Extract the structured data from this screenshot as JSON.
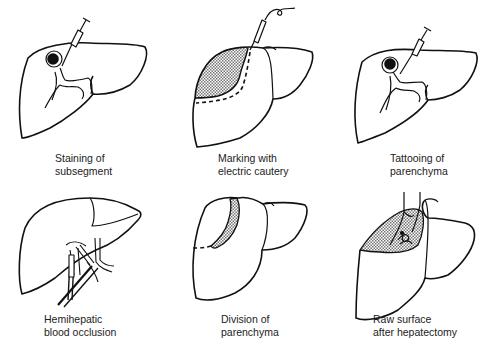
{
  "figure": {
    "type": "procedure-diagram",
    "layout": {
      "rows": 2,
      "cols": 3
    },
    "colors": {
      "line": "#111111",
      "background": "#ffffff",
      "hatch": "#888888",
      "caption": "#222222"
    },
    "panels": [
      {
        "id": "staining",
        "caption_lines": [
          "Staining of",
          "subsegment"
        ],
        "icons": [
          "liver-icon",
          "syringe-icon",
          "portal-vein-icon",
          "tumor-icon"
        ]
      },
      {
        "id": "marking",
        "caption_lines": [
          "Marking with",
          "electric cautery"
        ],
        "icons": [
          "liver-icon",
          "cautery-probe-icon",
          "stained-area-icon",
          "dashed-resection-line-icon"
        ]
      },
      {
        "id": "tattooing",
        "caption_lines": [
          "Tattooing of",
          "parenchyma"
        ],
        "icons": [
          "liver-icon",
          "syringe-icon",
          "portal-vein-icon",
          "tumor-icon"
        ]
      },
      {
        "id": "occlusion",
        "caption_lines": [
          "Hemihepatic",
          "blood occlusion"
        ],
        "icons": [
          "liver-icon",
          "vascular-clamp-icon",
          "hilar-vessels-icon"
        ]
      },
      {
        "id": "division",
        "caption_lines": [
          "Division of",
          "parenchyma"
        ],
        "icons": [
          "liver-icon",
          "transection-plane-icon",
          "dashed-resection-line-icon"
        ]
      },
      {
        "id": "raw-surface",
        "caption_lines": [
          "Raw surface",
          "after hepatectomy"
        ],
        "icons": [
          "liver-icon",
          "raw-surface-icon",
          "vessel-stumps-icon"
        ]
      }
    ]
  }
}
